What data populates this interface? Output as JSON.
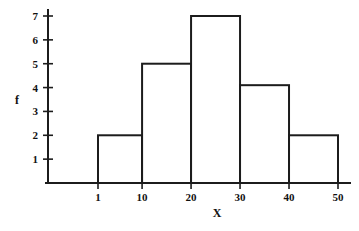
{
  "chart_data": {
    "type": "bar",
    "title": "",
    "subtitle": "",
    "xlabel": "X",
    "ylabel": "f",
    "categories": [
      "1-10",
      "10-20",
      "20-30",
      "30-40",
      "40-50"
    ],
    "bin_edges": [
      1,
      10,
      20,
      30,
      40,
      50
    ],
    "values": [
      2,
      5,
      7,
      4.1,
      2
    ],
    "x_tick_labels": [
      "1",
      "10",
      "20",
      "30",
      "40",
      "50"
    ],
    "x_tick_values": [
      1,
      10,
      20,
      30,
      40,
      50
    ],
    "y_tick_labels": [
      "1",
      "2",
      "3",
      "4",
      "5",
      "6",
      "7"
    ],
    "y_tick_values": [
      1,
      2,
      3,
      4,
      5,
      6,
      7
    ],
    "xlim": [
      -8,
      53
    ],
    "ylim": [
      0,
      7.6
    ],
    "grid": false,
    "legend": null,
    "bar_fill_color": "#ffffff",
    "bar_stroke_color": "#1c1c1c",
    "axis_color": "#1c1c1c",
    "background_color": "#ffffff"
  },
  "axes": {
    "y_axis_title": "f",
    "x_axis_title": "X"
  }
}
